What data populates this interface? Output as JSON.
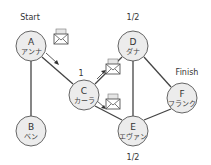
{
  "diagram": {
    "nodes": [
      {
        "id": "A",
        "letter": "A",
        "name": "アンナ"
      },
      {
        "id": "B",
        "letter": "B",
        "name": "ベン"
      },
      {
        "id": "C",
        "letter": "C",
        "name": "カーラ"
      },
      {
        "id": "D",
        "letter": "D",
        "name": "ダナ"
      },
      {
        "id": "E",
        "letter": "E",
        "name": "エヴァン"
      },
      {
        "id": "F",
        "letter": "F",
        "name": "フランク"
      }
    ],
    "edges": [
      {
        "from": "A",
        "to": "B"
      },
      {
        "from": "A",
        "to": "C"
      },
      {
        "from": "C",
        "to": "D"
      },
      {
        "from": "C",
        "to": "E"
      },
      {
        "from": "D",
        "to": "E"
      },
      {
        "from": "D",
        "to": "F"
      },
      {
        "from": "E",
        "to": "F"
      }
    ],
    "labels": {
      "start": "Start",
      "finish": "Finish",
      "c_value": "1",
      "d_value": "1/2",
      "e_value": "1/2"
    },
    "messages": [
      {
        "from": "A",
        "to": "C",
        "icon": "envelope-icon"
      },
      {
        "from": "C",
        "to": "D",
        "icon": "envelope-icon"
      },
      {
        "from": "C",
        "to": "E",
        "icon": "envelope-icon"
      }
    ]
  }
}
